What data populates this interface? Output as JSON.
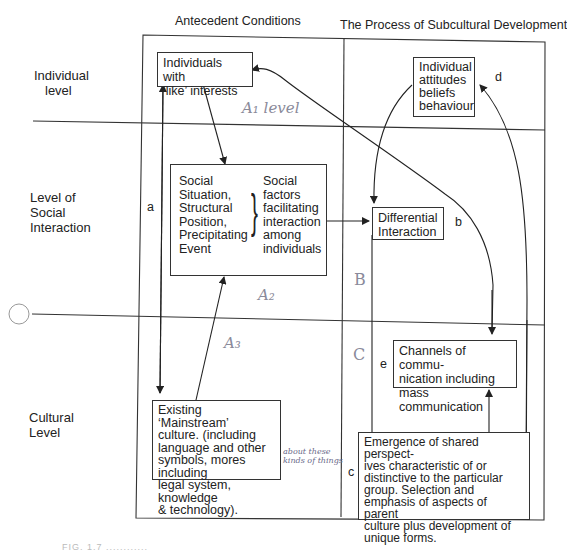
{
  "columns": {
    "antecedent": "Antecedent Conditions",
    "process": "The Process of Subcultural Development"
  },
  "rows": {
    "individual": [
      "Individual",
      "level"
    ],
    "social": [
      "Level of",
      "Social",
      "Interaction"
    ],
    "cultural": [
      "Cultural",
      "Level"
    ]
  },
  "boxes": {
    "like_interests": [
      "Individuals with",
      "‘like’ interests"
    ],
    "attitudes": [
      "Individual",
      "attitudes",
      "beliefs",
      "behaviour"
    ],
    "social_situation_left": [
      "Social",
      "Situation,",
      "Structural",
      "Position,",
      "Precipitating",
      "Event"
    ],
    "social_situation_right": [
      "Social",
      "factors",
      "facilitating",
      "interaction",
      "among",
      "individuals"
    ],
    "differential": [
      "Differential",
      "Interaction"
    ],
    "channels": [
      "Channels of commu-",
      "nication including",
      "mass communication"
    ],
    "mainstream": [
      "Existing ‘Mainstream’",
      "culture. (including",
      "language and other",
      "symbols, mores including",
      "legal system, knowledge",
      "& technology)."
    ],
    "emergence": [
      "Emergence of shared perspect-",
      "ives characteristic of or",
      "distinctive to the particular",
      "group. Selection and",
      "emphasis of aspects of parent",
      "culture plus development of",
      "unique forms."
    ]
  },
  "path_letters": {
    "a": "a",
    "b": "b",
    "c": "c",
    "d": "d",
    "e": "e"
  },
  "handwritten": {
    "a1": "A₁ level",
    "a2": "A₂",
    "a3": "A₃",
    "b": "B",
    "c": "C",
    "margin_note": [
      "about these",
      "kinds of things"
    ]
  },
  "caption": "FIG. 1.7 ............"
}
